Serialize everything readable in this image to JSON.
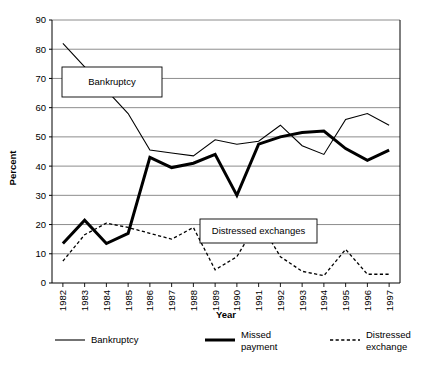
{
  "chart_data": {
    "type": "line",
    "title": "",
    "xlabel": "Year",
    "ylabel": "Percent",
    "ylim": [
      0,
      90
    ],
    "ytick_step": 10,
    "grid": true,
    "legend_position": "bottom",
    "categories": [
      "1982",
      "1983",
      "1984",
      "1985",
      "1986",
      "1987",
      "1988",
      "1989",
      "1990",
      "1991",
      "1992",
      "1993",
      "1994",
      "1995",
      "1996",
      "1997"
    ],
    "yticks": [
      "0",
      "10",
      "20",
      "30",
      "40",
      "50",
      "60",
      "70",
      "80",
      "90"
    ],
    "series": [
      {
        "name": "Bankruptcy",
        "style": "thin-solid",
        "color": "#000000",
        "values": [
          82,
          74,
          66,
          58,
          45.5,
          44.5,
          43.5,
          49,
          47.5,
          48.5,
          54,
          47,
          44,
          56,
          58,
          54
        ]
      },
      {
        "name": "Missed payment",
        "style": "thick-solid",
        "color": "#000000",
        "values": [
          13.5,
          21.5,
          13.5,
          17,
          43,
          39.5,
          41,
          44,
          30,
          47.5,
          50,
          51.5,
          52,
          46,
          42,
          45.5
        ]
      },
      {
        "name": "Distressed exchange",
        "style": "dotted",
        "color": "#000000",
        "values": [
          7.5,
          16.5,
          20.5,
          19,
          17,
          15,
          19,
          4.5,
          9,
          21.5,
          9,
          4,
          2.5,
          11.5,
          3,
          3
        ]
      }
    ],
    "annotations": [
      {
        "label": "Bankruptcy",
        "x": 62,
        "y": 67,
        "w": 100,
        "h": 30
      },
      {
        "label": "Distressed exchanges",
        "x": 200,
        "y": 219,
        "w": 117,
        "h": 24
      }
    ]
  },
  "legend": {
    "items": [
      {
        "label_line1": "Bankruptcy",
        "label_line2": "",
        "style": "thin-solid"
      },
      {
        "label_line1": "Missed",
        "label_line2": "payment",
        "style": "thick-solid"
      },
      {
        "label_line1": "Distressed",
        "label_line2": "exchange",
        "style": "dotted"
      }
    ]
  },
  "colors": {
    "line": "#000000",
    "grid": "#808080",
    "axis": "#000000",
    "background": "#ffffff"
  }
}
